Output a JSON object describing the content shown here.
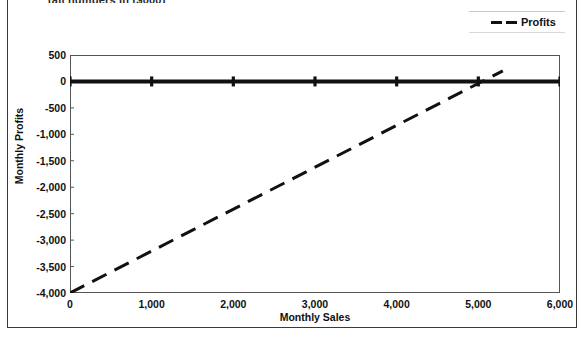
{
  "header": {
    "clipped_note": "(all numbers in ($000)"
  },
  "legend": {
    "entries": [
      {
        "label": "Profits",
        "style": "dashed",
        "color": "#111111"
      }
    ]
  },
  "axes": {
    "x_title": "Monthly Sales",
    "y_title": "Monthly Profits",
    "x_ticks": [
      "0",
      "1,000",
      "2,000",
      "3,000",
      "4,000",
      "5,000",
      "6,000"
    ],
    "y_ticks": [
      "500",
      "0",
      "-500",
      "-1,000",
      "-1,500",
      "-2,000",
      "-2,500",
      "-3,000",
      "-3,500",
      "-4,000"
    ]
  },
  "chart_data": {
    "type": "line",
    "title": "",
    "xlabel": "Monthly Sales",
    "ylabel": "Monthly Profits",
    "xlim": [
      0,
      6000
    ],
    "ylim": [
      -4000,
      500
    ],
    "grid": false,
    "legend_position": "top-right",
    "x_ticks": [
      0,
      1000,
      2000,
      3000,
      4000,
      5000,
      6000
    ],
    "y_ticks": [
      500,
      0,
      -500,
      -1000,
      -1500,
      -2000,
      -2500,
      -3000,
      -3500,
      -4000
    ],
    "series": [
      {
        "name": "Zero Axis",
        "style": "solid",
        "color": "#111111",
        "width": 4,
        "markers": true,
        "x": [
          0,
          1000,
          2000,
          3000,
          4000,
          5000,
          6000
        ],
        "values": [
          0,
          0,
          0,
          0,
          0,
          0,
          0
        ]
      },
      {
        "name": "Profits",
        "style": "dashed",
        "color": "#111111",
        "width": 3,
        "markers": false,
        "x": [
          0,
          5300
        ],
        "values": [
          -4000,
          200
        ]
      }
    ]
  }
}
